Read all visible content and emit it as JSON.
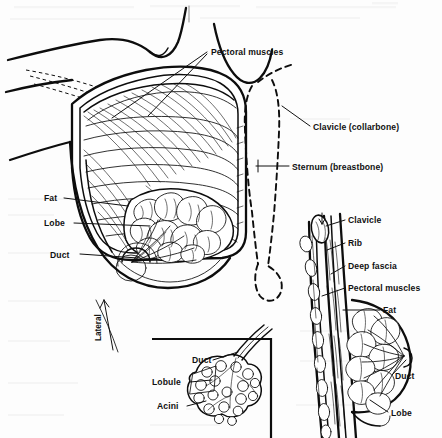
{
  "figure": {
    "background_color": "#fdfdfd",
    "ink_color": "#0d0d0d"
  },
  "main_view": {
    "name": "anterolateral-dissection",
    "labels": {
      "pectoral_muscles": "Pectoral muscles",
      "clavicle": "Clavicle (collarbone)",
      "sternum": "Sternum (breastbone)",
      "fat": "Fat",
      "lobe": "Lobe",
      "duct": "Duct",
      "lateral": "Lateral"
    }
  },
  "inset_view": {
    "name": "lobule-detail",
    "labels": {
      "duct": "Duct",
      "lobule": "Lobule",
      "acini": "Acini"
    }
  },
  "sagittal_view": {
    "name": "sagittal-section",
    "labels": {
      "clavicle": "Clavicle",
      "rib": "Rib",
      "deep_fascia": "Deep fascia",
      "pectoral_muscles": "Pectoral muscles",
      "fat": "Fat",
      "duct": "Duct",
      "lobe": "Lobe"
    }
  }
}
